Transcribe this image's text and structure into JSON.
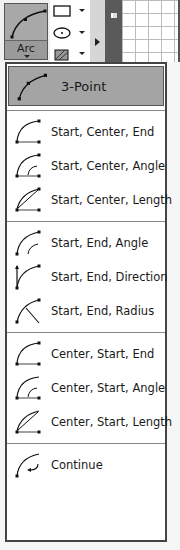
{
  "ribbon": {
    "arc_button_label": "Arc",
    "tools": [
      {
        "name": "rectangle",
        "icon": "rectangle-icon"
      },
      {
        "name": "ellipse",
        "icon": "ellipse-icon"
      },
      {
        "name": "hatch",
        "icon": "hatch-icon"
      }
    ]
  },
  "menu": {
    "groups": [
      [
        {
          "label": "3-Point",
          "icon": "arc-3point-icon",
          "selected": true
        }
      ],
      [
        {
          "label": "Start, Center, End",
          "icon": "arc-start-center-end-icon"
        },
        {
          "label": "Start, Center, Angle",
          "icon": "arc-start-center-angle-icon"
        },
        {
          "label": "Start, Center, Length",
          "icon": "arc-start-center-length-icon"
        }
      ],
      [
        {
          "label": "Start, End, Angle",
          "icon": "arc-start-end-angle-icon"
        },
        {
          "label": "Start, End, Direction",
          "icon": "arc-start-end-direction-icon"
        },
        {
          "label": "Start, End, Radius",
          "icon": "arc-start-end-radius-icon"
        }
      ],
      [
        {
          "label": "Center, Start, End",
          "icon": "arc-center-start-end-icon"
        },
        {
          "label": "Center, Start, Angle",
          "icon": "arc-center-start-angle-icon"
        },
        {
          "label": "Center, Start, Length",
          "icon": "arc-center-start-length-icon"
        }
      ],
      [
        {
          "label": "Continue",
          "icon": "arc-continue-icon"
        }
      ]
    ]
  }
}
